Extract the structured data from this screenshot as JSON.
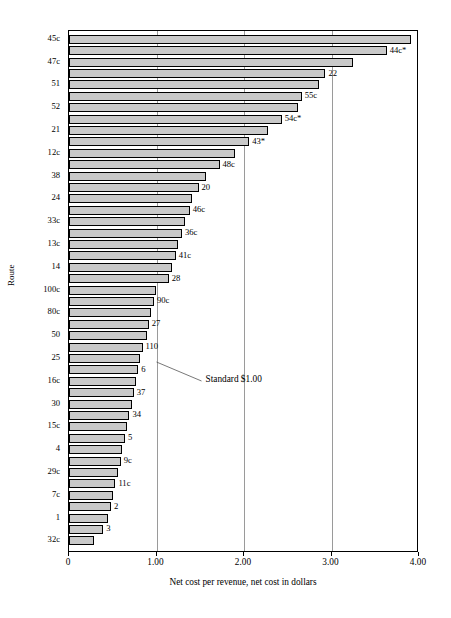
{
  "chart_data": {
    "type": "bar",
    "orientation": "horizontal",
    "title": "",
    "xlabel": "Net cost per revenue, net cost in dollars",
    "ylabel": "Route",
    "xlim": [
      0,
      4.0
    ],
    "xticks": [
      "0",
      "1.00",
      "2.00",
      "3.00",
      "4.00"
    ],
    "xtick_values": [
      0,
      1.0,
      2.0,
      3.0,
      4.0
    ],
    "grid": "vertical",
    "legend": "none",
    "annotations": [
      {
        "text": "Standard $1.00",
        "points_to_x": 1.0
      }
    ],
    "categories": [
      "45c",
      "44c*",
      "47c",
      "22",
      "51",
      "55c",
      "52",
      "54c*",
      "21",
      "43*",
      "12c",
      "48c",
      "38",
      "20",
      "24",
      "46c",
      "33c",
      "36c",
      "13c",
      "41c",
      "14",
      "28",
      "100c",
      "90c",
      "80c",
      "27",
      "50",
      "110",
      "25",
      "6",
      "16c",
      "37",
      "30",
      "34",
      "15c",
      "5",
      "4",
      "9c",
      "29c",
      "11c",
      "7c",
      "2",
      "1",
      "3",
      "32c"
    ],
    "values": [
      3.91,
      3.63,
      3.25,
      2.93,
      2.86,
      2.66,
      2.62,
      2.43,
      2.27,
      2.06,
      1.9,
      1.72,
      1.56,
      1.48,
      1.41,
      1.38,
      1.32,
      1.29,
      1.25,
      1.22,
      1.18,
      1.14,
      0.99,
      0.97,
      0.94,
      0.91,
      0.89,
      0.84,
      0.81,
      0.79,
      0.77,
      0.74,
      0.72,
      0.69,
      0.66,
      0.64,
      0.61,
      0.59,
      0.56,
      0.53,
      0.5,
      0.48,
      0.44,
      0.39,
      0.28
    ],
    "label_side": [
      "axis",
      "end",
      "axis",
      "end",
      "axis",
      "end",
      "axis",
      "end",
      "axis",
      "end",
      "axis",
      "end",
      "axis",
      "end",
      "axis",
      "end",
      "axis",
      "end",
      "axis",
      "end",
      "axis",
      "end",
      "axis",
      "end",
      "axis",
      "end",
      "axis",
      "end",
      "axis",
      "end",
      "axis",
      "end",
      "axis",
      "end",
      "axis",
      "end",
      "axis",
      "end",
      "axis",
      "end",
      "axis",
      "end",
      "axis",
      "end",
      "axis"
    ],
    "bar_color": "#c9c9c9",
    "bar_edge_color": "#000000",
    "gridline_color": "#9a9a9a"
  },
  "axis": {
    "y_title": "Route",
    "x_title": "Net cost per revenue, net cost in dollars"
  },
  "annotation": {
    "standard_label": "Standard $1.00"
  }
}
